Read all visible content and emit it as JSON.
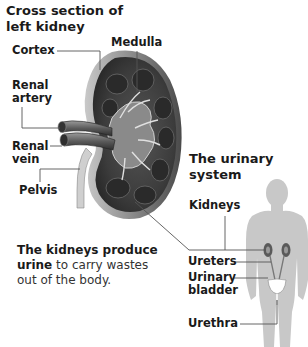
{
  "kidney_section": {
    "title_line1": "Cross section of",
    "title_line2": "left kidney",
    "labels": {
      "cortex": "Cortex",
      "medulla": "Medulla",
      "renal_artery_1": "Renal",
      "renal_artery_2": "artery",
      "renal_vein_1": "Renal",
      "renal_vein_2": "vein",
      "pelvis": "Pelvis"
    }
  },
  "description": {
    "bold_1": "The kidneys produce",
    "bold_2": "urine",
    "rest_2": " to carry wastes",
    "line_3": "out of the body."
  },
  "urinary_system": {
    "title_line1": "The urinary",
    "title_line2": "system",
    "labels": {
      "kidneys": "Kidneys",
      "ureters": "Ureters",
      "bladder_1": "Urinary",
      "bladder_2": "bladder",
      "urethra": "Urethra"
    }
  },
  "colors": {
    "leader_line": "#555555",
    "silhouette": "#c8c8c8",
    "kidney_dark": "#3a3a3a",
    "kidney_mid": "#6a6a6a",
    "kidney_light": "#b5b5b5"
  }
}
